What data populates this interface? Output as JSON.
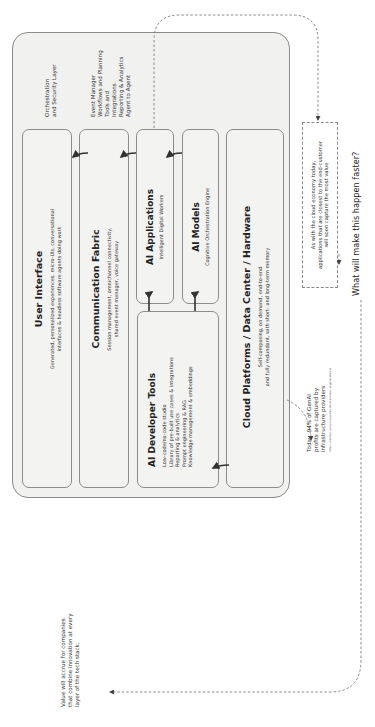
{
  "diagram": {
    "orientation": "rotated-90-ccw",
    "side_labels": {
      "orchestration": [
        "Orchestration",
        "and Security Layer"
      ],
      "event_manager": [
        "Event Manager",
        "Workflows and Planning",
        "Tools and",
        "Integrations",
        "Reporting & Analytics",
        "Agent to Agent"
      ]
    },
    "layers": {
      "user_interface": {
        "title": "User Interface",
        "description": [
          "Generated, personalized experiences, micro-UIs, conversational",
          "interfaces & headless software agents doing work"
        ]
      },
      "communication_fabric": {
        "title": "Communication Fabric",
        "description": [
          "Session management, omnichannel connectivity,",
          "shared event manager, voice gateway"
        ]
      },
      "ai_applications": {
        "title": "AI Applications",
        "description": [
          "Intelligent Digital Workers"
        ]
      },
      "ai_models": {
        "title": "AI Models",
        "description": [
          "Cognitive Orchestration Engine"
        ]
      },
      "ai_developer_tools": {
        "title": "AI Developer Tools",
        "items": [
          "Low-code/no-code studio",
          "Library of pre-built use cases & integrations",
          "Reporting & analytics",
          "Prompt engineering & RAG",
          "Knowledge management & embeddings"
        ]
      },
      "cloud_platforms": {
        "title": "Cloud Platforms / Data Center / Hardware",
        "description": [
          "Self-composing, on demand, end-to-end",
          "and fully redundant, with short- and long-term memory"
        ]
      }
    },
    "annotations": {
      "cloud_economy": [
        "As with the cloud economy today,",
        "applications that are closest to the end-customer",
        "will soon capture the most value"
      ],
      "question": "What will make this happen faster?",
      "genai_profits": [
        "Today, 94% of GenAI",
        "profits are captured by",
        "infrastructure providers"
      ],
      "source_url": "https://menlovc.com/perspective/the-economics-of-generative-ai",
      "value_accrual": [
        "Value will accrue for companies",
        "that combine innovation at every",
        "layer of the tech stack."
      ]
    },
    "colors": {
      "container_fill": "#f1f1f0",
      "box_border": "#8c8c8c",
      "arrow": "#333333",
      "dashed": "#8a8a8a"
    }
  }
}
